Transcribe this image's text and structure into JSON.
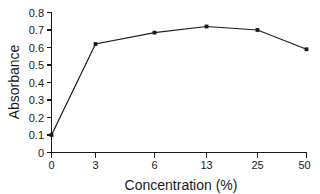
{
  "chart_data": {
    "type": "line",
    "title": "",
    "xlabel": "Concentration (%)",
    "ylabel": "Absorbance",
    "categories": [
      "0",
      "3",
      "6",
      "13",
      "25",
      "50"
    ],
    "x_tick_labels": [
      "0",
      "3",
      "6",
      "13",
      "25",
      "50"
    ],
    "y_tick_labels": [
      "0",
      "0.1",
      "0.2",
      "0.3",
      "0.4",
      "0.5",
      "0.6",
      "0.7",
      "0.8"
    ],
    "y_tick_values": [
      0,
      0.1,
      0.2,
      0.3,
      0.4,
      0.5,
      0.6,
      0.7,
      0.8
    ],
    "values": [
      0.1,
      0.62,
      0.685,
      0.72,
      0.7,
      0.59
    ],
    "ylim": [
      0,
      0.8
    ],
    "grid": false,
    "legend": false,
    "legend_position": "none",
    "marker": "square",
    "line_color": "#1a1a1a",
    "marker_color": "#1a1a1a",
    "background_color": "#ffffff"
  },
  "axes": {
    "y_title": "Absorbance",
    "x_title": "Concentration (%)"
  }
}
